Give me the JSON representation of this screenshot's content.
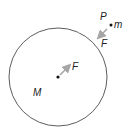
{
  "diagram": {
    "type": "gravitation-force-diagram",
    "large_body": {
      "label": "M",
      "center": [
        58,
        77
      ],
      "radius": 49,
      "color": "#333333"
    },
    "small_body": {
      "point_label": "P",
      "mass_label": "m",
      "position": [
        111,
        25
      ]
    },
    "forces": [
      {
        "label": "F",
        "on": "m",
        "direction": "toward M",
        "color": "#a6a6a6"
      },
      {
        "label": "F",
        "on": "M",
        "direction": "toward m",
        "color": "#a6a6a6"
      }
    ],
    "circle_gaps": [
      [
        38,
        28
      ],
      [
        80,
        31
      ]
    ]
  }
}
